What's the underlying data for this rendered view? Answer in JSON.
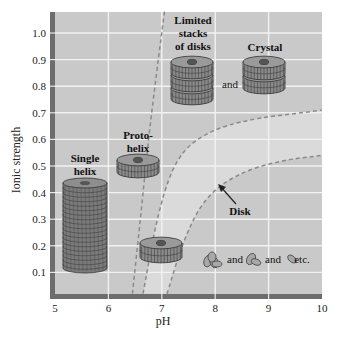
{
  "chart_data": {
    "type": "scatter",
    "title": "",
    "xlabel": "pH",
    "ylabel": "Ionic strength",
    "xlim": [
      5,
      10
    ],
    "ylim": [
      0,
      1.08
    ],
    "xticks": [
      5,
      6,
      7,
      8,
      9,
      10
    ],
    "yticks": [
      0.1,
      0.2,
      0.3,
      0.4,
      0.5,
      0.6,
      0.7,
      0.8,
      0.9,
      1.0
    ],
    "xtick_labels": [
      "5",
      "6",
      "7",
      "8",
      "9",
      "10"
    ],
    "ytick_labels": [
      "0.1",
      "0.2",
      "0.3",
      "0.4",
      "0.5",
      "0.6",
      "0.7",
      "0.8",
      "0.9",
      "1.0"
    ],
    "grid": true,
    "boundaries": [
      {
        "name": "helix-boundary",
        "style": "dashed",
        "points": [
          [
            6.45,
            0.02
          ],
          [
            6.6,
            0.3
          ],
          [
            6.75,
            0.6
          ],
          [
            6.9,
            0.85
          ],
          [
            7.05,
            1.08
          ]
        ]
      },
      {
        "name": "upper-disk-boundary",
        "style": "dashed",
        "points": [
          [
            6.65,
            0.02
          ],
          [
            6.9,
            0.3
          ],
          [
            7.2,
            0.5
          ],
          [
            7.6,
            0.6
          ],
          [
            8.4,
            0.67
          ],
          [
            10.0,
            0.71
          ]
        ]
      },
      {
        "name": "lower-disk-boundary",
        "style": "dashed",
        "points": [
          [
            7.1,
            0.02
          ],
          [
            7.4,
            0.22
          ],
          [
            7.8,
            0.38
          ],
          [
            8.4,
            0.47
          ],
          [
            9.2,
            0.52
          ],
          [
            10.0,
            0.54
          ]
        ]
      }
    ],
    "regions": [
      {
        "label": "Single helix",
        "x": 5.55,
        "y": 0.27,
        "shape": "cylinder"
      },
      {
        "label": "Proto-helix",
        "x": 6.55,
        "y": 0.49,
        "shape": "disk"
      },
      {
        "label": "Limited stacks of disks",
        "x": 7.4,
        "y": 0.85,
        "shape": "stack3"
      },
      {
        "label": "Crystal",
        "x": 8.75,
        "y": 0.87,
        "shape": "stack2"
      },
      {
        "label": "Disk",
        "x": 7.95,
        "y": 0.39,
        "shape": "arrow"
      },
      {
        "label": "",
        "x": 6.95,
        "y": 0.18,
        "shape": "disk"
      }
    ],
    "annotations": {
      "and_1": "and",
      "small_and_1": "and",
      "small_and_2": "and",
      "etc": "etc.",
      "proto_line1": "Proto-",
      "proto_line2": "helix",
      "single_line1": "Single",
      "single_line2": "helix",
      "limited_line1": "Limited",
      "limited_line2": "stacks",
      "limited_line3": "of disks",
      "crystal": "Crystal",
      "disk": "Disk"
    },
    "colors": {
      "background": "#c9c9c9",
      "disk_band": "#dadada",
      "axis_bar": "#6d6d6d",
      "grid": "#f2f2f2",
      "dash": "#8a8a8a",
      "glyph_fill": "#8a8a8a",
      "glyph_stroke": "#333333"
    }
  }
}
